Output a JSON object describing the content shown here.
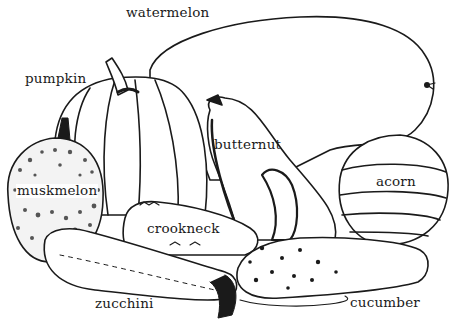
{
  "illustration": {
    "subject": "assorted squashes and gourds line drawing",
    "colors": {
      "ink": "#1a1a1a",
      "paper": "#ffffff",
      "stipple": "#555555"
    },
    "labels": [
      {
        "id": "watermelon",
        "text": "watermelon",
        "x": 126,
        "y": 6
      },
      {
        "id": "pumpkin",
        "text": "pumpkin",
        "x": 25,
        "y": 72
      },
      {
        "id": "butternut",
        "text": "butternut",
        "x": 214,
        "y": 138
      },
      {
        "id": "acorn",
        "text": "acorn",
        "x": 376,
        "y": 175
      },
      {
        "id": "muskmelon",
        "text": "muskmelon",
        "x": 16,
        "y": 184
      },
      {
        "id": "crookneck",
        "text": "crookneck",
        "x": 147,
        "y": 222
      },
      {
        "id": "zucchini",
        "text": "zucchini",
        "x": 95,
        "y": 297
      },
      {
        "id": "cucumber",
        "text": "cucumber",
        "x": 350,
        "y": 296
      }
    ]
  }
}
